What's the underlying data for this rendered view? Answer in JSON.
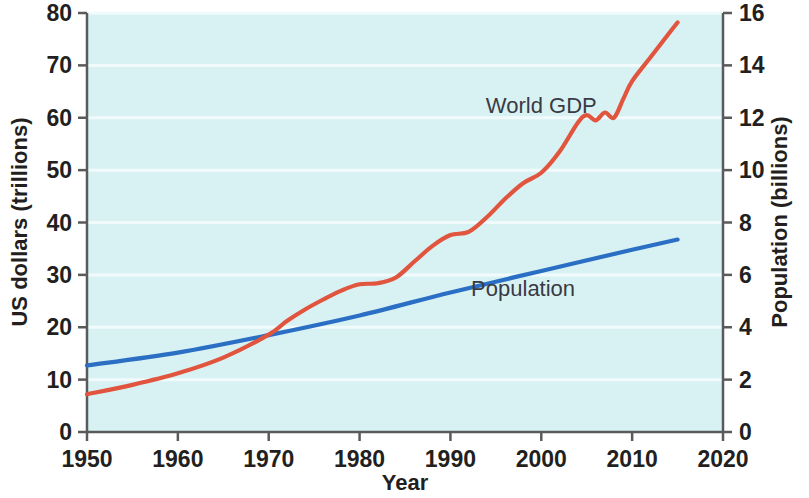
{
  "chart_data": {
    "type": "line",
    "title": "",
    "xlabel": "Year",
    "ylabel": "US dollars (trillions)",
    "y2label": "Population (billions)",
    "xlim": [
      1950,
      2020
    ],
    "ylim": [
      0,
      80
    ],
    "y2lim": [
      0,
      16
    ],
    "xticks": [
      1950,
      1960,
      1970,
      1980,
      1990,
      2000,
      2010,
      2020
    ],
    "yticks": [
      0,
      10,
      20,
      30,
      40,
      50,
      60,
      70,
      80
    ],
    "y2ticks": [
      0,
      2,
      4,
      6,
      8,
      10,
      12,
      14,
      16
    ],
    "grid": true,
    "grid_axis": "y",
    "legend_position": "inline-annotations",
    "plot_background": "#d8f2f4",
    "series": [
      {
        "name": "World GDP",
        "axis": "left",
        "unit": "trillions of US dollars",
        "color": "#e1543d",
        "label_x": 2000,
        "label_y": 61,
        "x": [
          1950,
          1955,
          1960,
          1965,
          1970,
          1972,
          1974,
          1976,
          1978,
          1980,
          1982,
          1984,
          1986,
          1988,
          1990,
          1992,
          1994,
          1996,
          1998,
          2000,
          2002,
          2004,
          2005,
          2006,
          2007,
          2008,
          2009,
          2010,
          2012,
          2014,
          2015
        ],
        "y": [
          7.2,
          9.0,
          11.2,
          14.2,
          18.6,
          21.2,
          23.4,
          25.3,
          27.0,
          28.2,
          28.4,
          29.5,
          32.5,
          35.5,
          37.6,
          38.2,
          41.0,
          44.5,
          47.5,
          49.5,
          53.5,
          59.0,
          60.5,
          59.5,
          61.0,
          60.0,
          63.5,
          67.0,
          71.5,
          76.0,
          78.2
        ]
      },
      {
        "name": "Population",
        "axis": "right",
        "unit": "billions",
        "color": "#2b6fc4",
        "label_x": 1998,
        "label_y_left_scale": 26,
        "x": [
          1950,
          1960,
          1970,
          1980,
          1990,
          2000,
          2010,
          2015
        ],
        "y": [
          2.54,
          3.03,
          3.7,
          4.45,
          5.33,
          6.15,
          6.96,
          7.35
        ]
      }
    ],
    "annotations": [
      {
        "text": "World GDP",
        "series": "World GDP"
      },
      {
        "text": "Population",
        "series": "Population"
      }
    ]
  },
  "axes": {
    "x": {
      "title": "Year",
      "tick_labels": [
        "1950",
        "1960",
        "1970",
        "1980",
        "1990",
        "2000",
        "2010",
        "2020"
      ]
    },
    "y_left": {
      "title": "US dollars (trillions)",
      "tick_labels": [
        "0",
        "10",
        "20",
        "30",
        "40",
        "50",
        "60",
        "70",
        "80"
      ]
    },
    "y_right": {
      "title": "Population (billions)",
      "tick_labels": [
        "0",
        "2",
        "4",
        "6",
        "8",
        "10",
        "12",
        "14",
        "16"
      ]
    }
  },
  "colors": {
    "gdp_line": "#e1543d",
    "population_line": "#2b6fc4",
    "plot_fill": "#d8f2f4",
    "gridline": "#f2fbfc",
    "axis": "#5a5a5a",
    "text": "#231f20"
  }
}
